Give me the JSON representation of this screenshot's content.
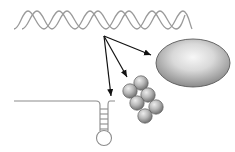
{
  "diagram": {
    "colors": {
      "background": "#ffffff",
      "helix_strand": "#9a9a9a",
      "arrow": "#111111",
      "hairpin_line": "#8c8c8c",
      "sphere_light": "#e6e6e6",
      "sphere_dark": "#7a7a7a",
      "ellipse_light": "#f4f4f4",
      "ellipse_dark": "#8a8a8a",
      "outline": "#555555"
    },
    "elements": [
      {
        "id": "dna-helix",
        "shape": "double helix",
        "label": ""
      },
      {
        "id": "arrow-origin",
        "shape": "point",
        "label": ""
      },
      {
        "id": "rna-hairpin",
        "shape": "stem-loop",
        "label": ""
      },
      {
        "id": "sphere-cluster",
        "shape": "cluster of 6 spheres",
        "label": ""
      },
      {
        "id": "ellipsoid",
        "shape": "shaded ellipse",
        "label": ""
      }
    ],
    "arrows": [
      {
        "from": "arrow-origin",
        "to": "rna-hairpin"
      },
      {
        "from": "arrow-origin",
        "to": "sphere-cluster"
      },
      {
        "from": "arrow-origin",
        "to": "ellipsoid"
      }
    ]
  }
}
